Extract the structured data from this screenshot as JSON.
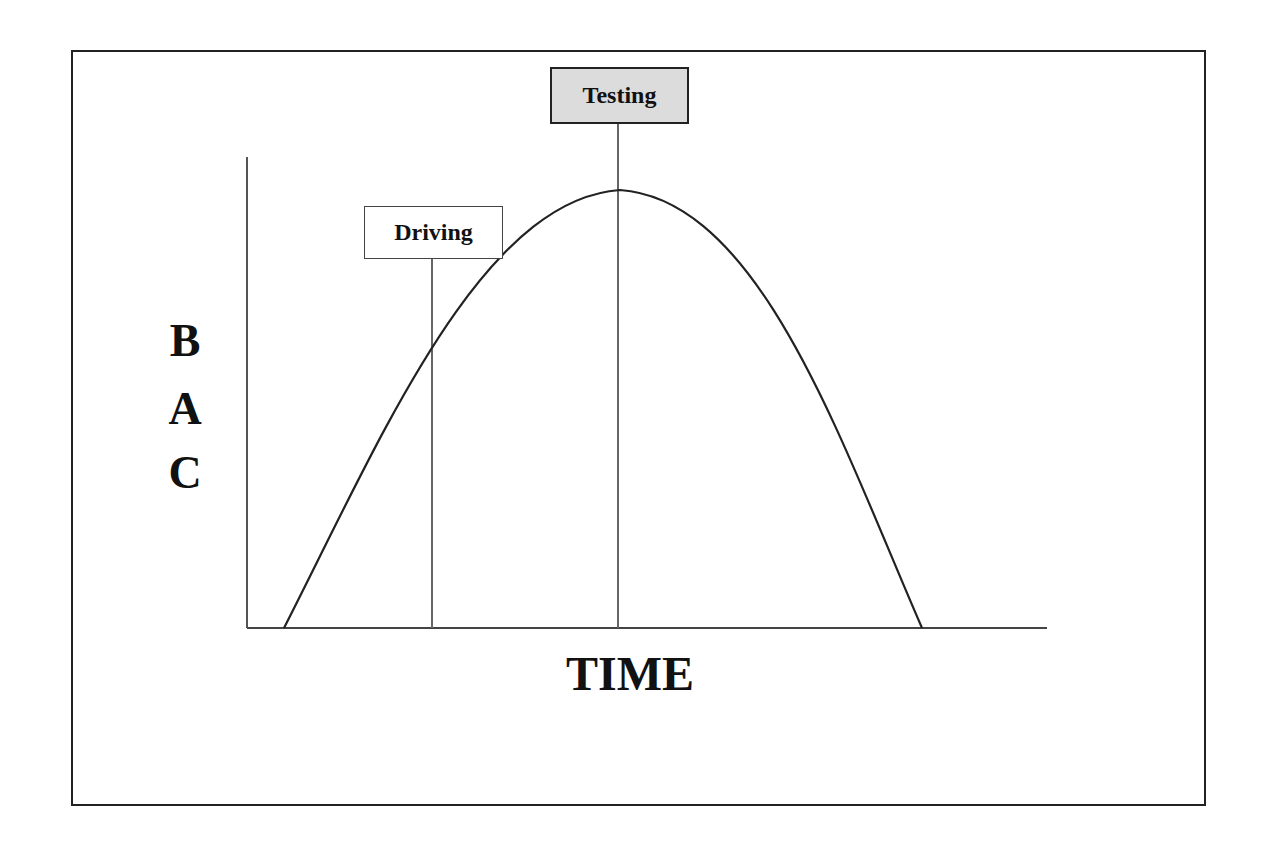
{
  "diagram": {
    "title": "",
    "y_axis_label": [
      "B",
      "A",
      "C"
    ],
    "x_axis_label": "TIME",
    "markers": [
      {
        "label": "Driving",
        "x": 432,
        "style": "outlined"
      },
      {
        "label": "Testing",
        "x": 618,
        "style": "shaded"
      }
    ],
    "curve": {
      "shape": "bell / inverted parabola",
      "start_x": 284,
      "peak": {
        "x": 620,
        "y": 190
      },
      "end_x": 922
    },
    "colors": {
      "line": "#222222",
      "marker_line": "#666666",
      "testing_fill": "#dcdcdc"
    }
  }
}
